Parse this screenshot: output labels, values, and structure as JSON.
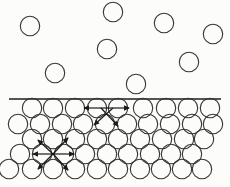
{
  "figure": {
    "canvas": {
      "width": 230,
      "height": 187,
      "background": "#fcfcfa"
    },
    "style": {
      "molecule_stroke": "#333333",
      "molecule_fill": "none",
      "molecule_stroke_width": 1.1,
      "molecule_radius": 9.7,
      "arrow_color": "#1a1a1a",
      "arrow_stroke_width": 1.2,
      "line_color": "#555555",
      "line_width": 2
    },
    "surface_line": {
      "x1": 9,
      "y1": 99,
      "x2": 221,
      "y2": 99
    },
    "gas_molecules": [
      [
        30,
        26
      ],
      [
        113,
        12
      ],
      [
        164,
        23
      ],
      [
        213,
        34
      ],
      [
        107,
        49
      ],
      [
        189,
        62
      ],
      [
        55,
        73
      ],
      [
        136,
        84
      ]
    ],
    "liquid_rows": [
      {
        "y": 108,
        "x": [
          32,
          53,
          75,
          97,
          118,
          143,
          166,
          188,
          210
        ]
      },
      {
        "y": 124,
        "x": [
          18,
          40,
          62,
          83,
          105,
          127,
          148,
          170,
          192,
          213
        ]
      },
      {
        "y": 139,
        "x": [
          32,
          53,
          75,
          97,
          118,
          140,
          162,
          184,
          204
        ]
      },
      {
        "y": 154,
        "x": [
          20,
          42,
          64,
          85,
          107,
          128,
          150,
          171,
          192
        ]
      },
      {
        "y": 169,
        "x": [
          9,
          32,
          53,
          75,
          97,
          118,
          140,
          161,
          182,
          202
        ]
      }
    ],
    "force_arrows": {
      "surface_molecule": {
        "center": [
          107,
          109
        ],
        "arrows": [
          {
            "x1": 107,
            "y1": 108,
            "x2": 84,
            "y2": 108
          },
          {
            "x1": 107,
            "y1": 108,
            "x2": 129,
            "y2": 108
          },
          {
            "x1": 113,
            "y1": 108,
            "x2": 94,
            "y2": 125
          },
          {
            "x1": 101,
            "y1": 108,
            "x2": 118,
            "y2": 126
          }
        ]
      },
      "interior_molecule": {
        "center": [
          53,
          154
        ],
        "arrows": [
          {
            "x1": 53,
            "y1": 154,
            "x2": 33,
            "y2": 154
          },
          {
            "x1": 53,
            "y1": 154,
            "x2": 74,
            "y2": 154
          },
          {
            "x1": 53,
            "y1": 154,
            "x2": 38,
            "y2": 140
          },
          {
            "x1": 53,
            "y1": 154,
            "x2": 68,
            "y2": 138
          },
          {
            "x1": 53,
            "y1": 154,
            "x2": 38,
            "y2": 169
          },
          {
            "x1": 53,
            "y1": 154,
            "x2": 68,
            "y2": 170
          }
        ]
      }
    }
  }
}
